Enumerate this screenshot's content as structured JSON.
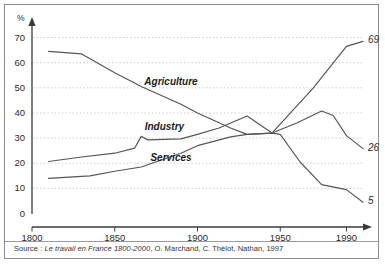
{
  "figure": {
    "source_prefix": "Source : ",
    "source_italic": "Le travail en France 1800-2000",
    "source_rest": ", O. Marchand, C. Thélot, Nathan, 1997"
  },
  "chart_data": {
    "type": "line",
    "title": "",
    "subtitle": "",
    "xlabel": "",
    "ylabel": "%",
    "xlim": [
      1800,
      2000
    ],
    "ylim": [
      0,
      72
    ],
    "xticks": [
      1800,
      1850,
      1900,
      1950,
      1990
    ],
    "xticklabels": [
      "1800",
      "1850",
      "1900",
      "1950",
      "1990"
    ],
    "yticks": [
      0,
      10,
      20,
      30,
      40,
      50,
      60,
      70
    ],
    "yticklabels": [
      "0",
      "10",
      "20",
      "30",
      "40",
      "50",
      "60",
      "70"
    ],
    "grid": "horizontal-dashed",
    "legend": "inline-labels",
    "line_color": "#555555",
    "grid_color": "#bcbcbc",
    "axis_color": "#3a3a3a",
    "series": [
      {
        "name": "Agriculture",
        "label_x": 1884,
        "label_y": 52.5,
        "end_value_text": "5",
        "points": [
          [
            1810,
            64.5
          ],
          [
            1830,
            63.5
          ],
          [
            1850,
            56.0
          ],
          [
            1866,
            50.5
          ],
          [
            1890,
            43.5
          ],
          [
            1900,
            40.0
          ],
          [
            1920,
            34.0
          ],
          [
            1930,
            31.5
          ],
          [
            1945,
            32.0
          ],
          [
            1950,
            31.5
          ],
          [
            1962,
            20.5
          ],
          [
            1975,
            11.5
          ],
          [
            1990,
            9.5
          ],
          [
            2000,
            4.5
          ]
        ]
      },
      {
        "name": "Industry",
        "label_x": 1880,
        "label_y": 34.5,
        "end_value_text": "26",
        "points": [
          [
            1810,
            20.7
          ],
          [
            1830,
            22.5
          ],
          [
            1850,
            24.0
          ],
          [
            1862,
            26.0
          ],
          [
            1866,
            30.7
          ],
          [
            1870,
            29.3
          ],
          [
            1890,
            29.7
          ],
          [
            1900,
            31.5
          ],
          [
            1913,
            34.0
          ],
          [
            1930,
            38.8
          ],
          [
            1945,
            32.0
          ],
          [
            1960,
            36.0
          ],
          [
            1975,
            40.8
          ],
          [
            1982,
            39.0
          ],
          [
            1990,
            31.0
          ],
          [
            2000,
            25.8
          ]
        ]
      },
      {
        "name": "Services",
        "label_x": 1884,
        "label_y": 22.0,
        "end_value_text": "69",
        "points": [
          [
            1810,
            14.0
          ],
          [
            1835,
            15.0
          ],
          [
            1850,
            16.8
          ],
          [
            1866,
            18.5
          ],
          [
            1890,
            24.0
          ],
          [
            1900,
            27.0
          ],
          [
            1920,
            30.5
          ],
          [
            1930,
            31.5
          ],
          [
            1945,
            32.0
          ],
          [
            1970,
            50.0
          ],
          [
            1990,
            66.5
          ],
          [
            2000,
            68.5
          ]
        ]
      }
    ]
  }
}
